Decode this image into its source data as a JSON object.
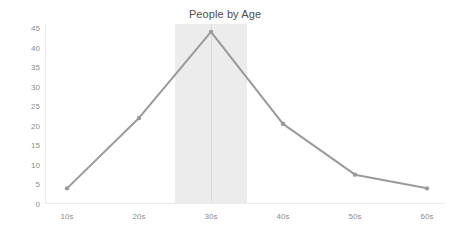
{
  "chart_data": {
    "type": "line",
    "title": "People by Age",
    "xlabel": "",
    "ylabel": "",
    "categories": [
      "10s",
      "20s",
      "30s",
      "40s",
      "50s",
      "60s"
    ],
    "values": [
      4,
      22,
      44,
      20.5,
      7.5,
      4
    ],
    "series": [
      {
        "name": "People",
        "values": [
          4,
          22,
          44,
          20.5,
          7.5,
          4
        ]
      }
    ],
    "ylim": [
      0,
      45
    ],
    "xlim": [
      0,
      5
    ],
    "yticks": [
      0,
      5,
      10,
      15,
      20,
      25,
      30,
      35,
      40,
      45
    ],
    "ytick_labels": [
      "0",
      "5",
      "10",
      "15",
      "20",
      "25",
      "30",
      "35",
      "40",
      "45"
    ],
    "grid": false,
    "legend": false,
    "legend_position": "none",
    "annotations": [
      {
        "name": "highlight-band",
        "type": "vertical-span",
        "from_index": 1.5,
        "to_index": 2.5,
        "color": "#ececec"
      },
      {
        "name": "highlight-marker-line",
        "type": "vertical-line",
        "at_index": 2,
        "at_category": "30s",
        "color": "#dcdcdc"
      }
    ],
    "colors": {
      "line": "#9a9a9a",
      "marker": "#9a9a9a",
      "background": "#ffffff",
      "axis": "#ebebeb",
      "tick_label": "#8c8c8c",
      "title": "#4d4d4d",
      "highlight_band": "#ececec",
      "marker_line": "#dcdcdc"
    }
  }
}
